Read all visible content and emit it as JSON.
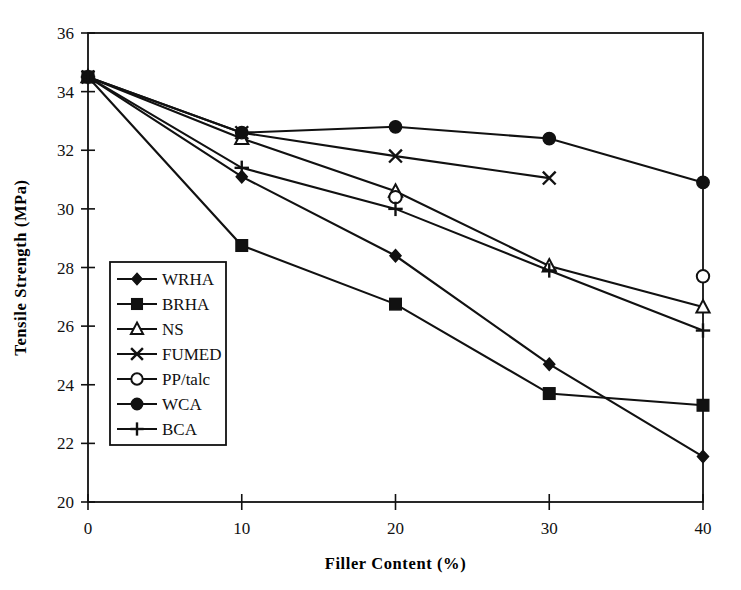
{
  "chart_data": {
    "type": "line",
    "title": "",
    "xlabel": "Filler Content (%)",
    "ylabel": "Tensile Strength (MPa)",
    "xlim": [
      0,
      40
    ],
    "ylim": [
      20,
      36
    ],
    "xticks": [
      0,
      10,
      20,
      30,
      40
    ],
    "yticks": [
      20,
      22,
      24,
      26,
      28,
      30,
      32,
      34,
      36
    ],
    "xticklabels": [
      "0",
      "10",
      "20",
      "30",
      "40"
    ],
    "yticklabels": [
      "20",
      "22",
      "24",
      "26",
      "28",
      "30",
      "32",
      "34",
      "36"
    ],
    "grid": false,
    "legend_position": "center-left-inside",
    "x": [
      0,
      10,
      20,
      30,
      40
    ],
    "series": [
      {
        "name": "WRHA",
        "marker": "filled-diamond",
        "connected": true,
        "x": [
          0,
          10,
          20,
          30,
          40
        ],
        "values": [
          34.5,
          31.1,
          28.4,
          24.7,
          21.55
        ]
      },
      {
        "name": "BRHA",
        "marker": "filled-square",
        "connected": true,
        "x": [
          0,
          10,
          20,
          30,
          40
        ],
        "values": [
          34.5,
          28.75,
          26.75,
          23.7,
          23.3
        ]
      },
      {
        "name": "NS",
        "marker": "open-triangle",
        "connected": true,
        "x": [
          0,
          10,
          20,
          30,
          40
        ],
        "values": [
          34.5,
          32.4,
          30.6,
          28.05,
          26.65
        ]
      },
      {
        "name": "FUMED",
        "marker": "cross-x",
        "connected": true,
        "x": [
          0,
          10,
          20,
          30
        ],
        "values": [
          34.5,
          32.6,
          31.8,
          31.05
        ]
      },
      {
        "name": "PP/talc",
        "marker": "open-circle",
        "connected": false,
        "x": [
          20,
          40
        ],
        "values": [
          30.4,
          27.7
        ]
      },
      {
        "name": "WCA",
        "marker": "filled-circle",
        "connected": true,
        "x": [
          0,
          10,
          20,
          30,
          40
        ],
        "values": [
          34.5,
          32.6,
          32.8,
          32.4,
          30.9
        ]
      },
      {
        "name": "BCA",
        "marker": "plus",
        "connected": true,
        "x": [
          0,
          10,
          20,
          30,
          40
        ],
        "values": [
          34.5,
          31.4,
          30.0,
          27.9,
          25.85
        ]
      }
    ]
  },
  "colors": {
    "ink": "#111111",
    "background": "#ffffff"
  }
}
